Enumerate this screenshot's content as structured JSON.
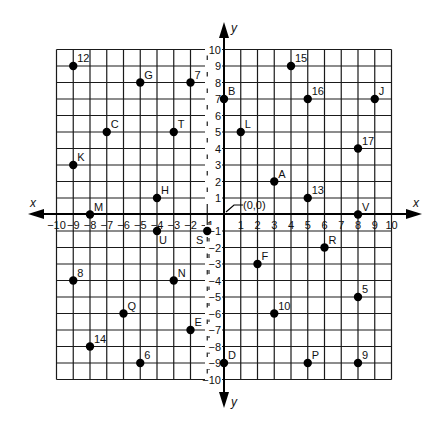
{
  "chart_data": {
    "type": "scatter",
    "title": "",
    "xlabel": "x",
    "ylabel": "y",
    "xlim": [
      -10,
      10
    ],
    "ylim": [
      -10,
      10
    ],
    "grid": true,
    "origin_label": "(0,0)",
    "x_ticks": [
      -10,
      -9,
      -8,
      -7,
      -6,
      -5,
      -4,
      -3,
      -2,
      -1,
      1,
      2,
      3,
      4,
      5,
      6,
      7,
      8,
      9,
      10
    ],
    "y_ticks": [
      -10,
      -9,
      -8,
      -7,
      -6,
      -5,
      -4,
      -3,
      -2,
      -1,
      1,
      2,
      3,
      4,
      5,
      6,
      7,
      8,
      9,
      10
    ],
    "points": [
      {
        "label": "12",
        "x": -9,
        "y": 9
      },
      {
        "label": "G",
        "x": -5,
        "y": 8
      },
      {
        "label": "7",
        "x": -2,
        "y": 8
      },
      {
        "label": "B",
        "x": 0,
        "y": 7
      },
      {
        "label": "C",
        "x": -7,
        "y": 5
      },
      {
        "label": "T",
        "x": -3,
        "y": 5
      },
      {
        "label": "K",
        "x": -9,
        "y": 3
      },
      {
        "label": "H",
        "x": -4,
        "y": 1
      },
      {
        "label": "M",
        "x": -8,
        "y": 0
      },
      {
        "label": "15",
        "x": 4,
        "y": 9
      },
      {
        "label": "16",
        "x": 5,
        "y": 7
      },
      {
        "label": "J",
        "x": 9,
        "y": 7
      },
      {
        "label": "L",
        "x": 1,
        "y": 5
      },
      {
        "label": "17",
        "x": 8,
        "y": 4
      },
      {
        "label": "A",
        "x": 3,
        "y": 2
      },
      {
        "label": "13",
        "x": 5,
        "y": 1
      },
      {
        "label": "V",
        "x": 8,
        "y": 0
      },
      {
        "label": "U",
        "x": -4,
        "y": -1
      },
      {
        "label": "S",
        "x": -1,
        "y": -1
      },
      {
        "label": "8",
        "x": -9,
        "y": -4
      },
      {
        "label": "N",
        "x": -3,
        "y": -4
      },
      {
        "label": "Q",
        "x": -6,
        "y": -6
      },
      {
        "label": "E",
        "x": -2,
        "y": -7
      },
      {
        "label": "14",
        "x": -8,
        "y": -8
      },
      {
        "label": "6",
        "x": -5,
        "y": -9
      },
      {
        "label": "D",
        "x": 0,
        "y": -9
      },
      {
        "label": "R",
        "x": 6,
        "y": -2
      },
      {
        "label": "F",
        "x": 2,
        "y": -3
      },
      {
        "label": "5",
        "x": 8,
        "y": -5
      },
      {
        "label": "10",
        "x": 3,
        "y": -6
      },
      {
        "label": "P",
        "x": 5,
        "y": -9
      },
      {
        "label": "9",
        "x": 8,
        "y": -9
      }
    ],
    "label_placement": {
      "U": "below-right",
      "S": "below-left"
    }
  }
}
